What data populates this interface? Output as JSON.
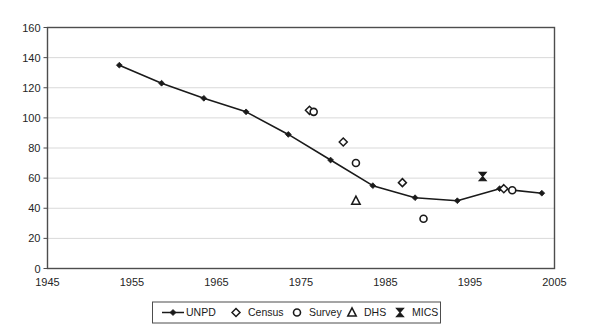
{
  "chart_data": {
    "type": "scatter",
    "title": "",
    "subtitle": "",
    "xlabel": "",
    "ylabel": "",
    "xlim": [
      1945,
      2005
    ],
    "ylim": [
      0,
      160
    ],
    "xticks": [
      1945,
      1955,
      1965,
      1975,
      1985,
      1995,
      2005
    ],
    "yticks": [
      0,
      20,
      40,
      60,
      80,
      100,
      120,
      140,
      160
    ],
    "grid": "horizontal",
    "legend_position": "bottom",
    "series": [
      {
        "name": "UNPD",
        "marker": "filled-diamond",
        "line": true,
        "x": [
          1953.5,
          1958.5,
          1963.5,
          1968.5,
          1973.5,
          1978.5,
          1983.5,
          1988.5,
          1993.5,
          1998.5,
          2003.5
        ],
        "values": [
          135,
          123,
          113,
          104,
          89,
          72,
          55,
          47,
          45,
          53,
          50
        ]
      },
      {
        "name": "Census",
        "marker": "open-diamond",
        "line": false,
        "x": [
          1976.0,
          1980.0,
          1987.0,
          1999.0
        ],
        "values": [
          105,
          84,
          57,
          53
        ]
      },
      {
        "name": "Survey",
        "marker": "open-circle",
        "line": false,
        "x": [
          1976.5,
          1981.5,
          1989.5,
          2000.0
        ],
        "values": [
          104,
          70,
          33,
          52
        ]
      },
      {
        "name": "DHS",
        "marker": "open-triangle",
        "line": false,
        "x": [
          1981.5
        ],
        "values": [
          45
        ]
      },
      {
        "name": "MICS",
        "marker": "bowtie",
        "line": false,
        "x": [
          1996.5
        ],
        "values": [
          61
        ]
      }
    ]
  },
  "legend": {
    "entries": [
      {
        "label": "UNPD",
        "marker": "line-filled-diamond"
      },
      {
        "label": "Census",
        "marker": "open-diamond"
      },
      {
        "label": "Survey",
        "marker": "open-circle"
      },
      {
        "label": "DHS",
        "marker": "open-triangle"
      },
      {
        "label": "MICS",
        "marker": "bowtie"
      }
    ]
  },
  "axes": {
    "y_labels": [
      "160",
      "140",
      "120",
      "100",
      "80",
      "60",
      "40",
      "20",
      "0"
    ],
    "x_labels": [
      "1945",
      "1955",
      "1965",
      "1975",
      "1985",
      "1995",
      "2005"
    ]
  },
  "colors": {
    "ink": "#1a1a1a",
    "grid": "#d9d9d9",
    "frame": "#4d4d4d",
    "background": "#ffffff"
  }
}
